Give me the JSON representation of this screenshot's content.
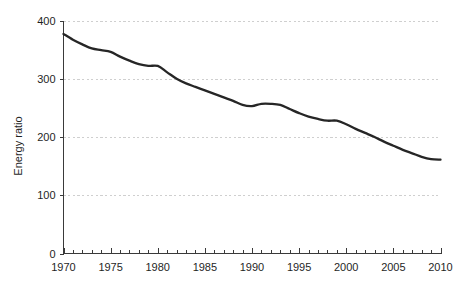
{
  "chart_data": {
    "type": "line",
    "title": "",
    "xlabel": "",
    "ylabel": "Energy ratio",
    "xlim": [
      1970,
      2010
    ],
    "ylim": [
      0,
      400
    ],
    "grid": true,
    "legend": false,
    "x_ticks": [
      1970,
      1975,
      1980,
      1985,
      1990,
      1995,
      2000,
      2005,
      2010
    ],
    "x_tick_labels": [
      "1970",
      "1975",
      "1980",
      "1985",
      "1990",
      "1995",
      "2000",
      "2005",
      "2010"
    ],
    "x_minor_tick_interval": 1,
    "y_ticks": [
      0,
      100,
      200,
      300,
      400
    ],
    "y_tick_labels": [
      "0",
      "100",
      "200",
      "300",
      "400"
    ],
    "line_color": "#262626",
    "grid_color": "#cfcfcf",
    "axis_color": "#3a3a3a",
    "background_color": "#ffffff",
    "series": [
      {
        "name": "Energy ratio",
        "x": [
          1970,
          1971,
          1972,
          1973,
          1974,
          1975,
          1976,
          1977,
          1978,
          1979,
          1980,
          1981,
          1982,
          1983,
          1984,
          1985,
          1986,
          1987,
          1988,
          1989,
          1990,
          1991,
          1992,
          1993,
          1994,
          1995,
          1996,
          1997,
          1998,
          1999,
          2000,
          2001,
          2002,
          2003,
          2004,
          2005,
          2006,
          2007,
          2008,
          2009,
          2010
        ],
        "values": [
          377,
          367,
          359,
          352,
          349,
          346,
          338,
          331,
          325,
          322,
          322,
          311,
          300,
          292,
          286,
          280,
          274,
          268,
          262,
          255,
          253,
          257,
          257,
          255,
          248,
          241,
          235,
          231,
          228,
          228,
          222,
          214,
          207,
          200,
          192,
          185,
          178,
          172,
          166,
          162,
          161
        ]
      }
    ]
  }
}
